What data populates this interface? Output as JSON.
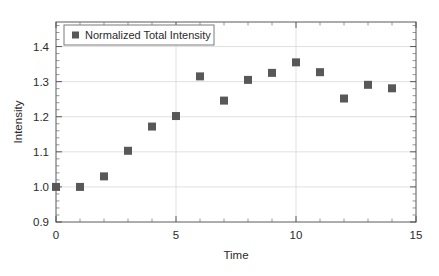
{
  "chart_data": {
    "type": "scatter",
    "title": "",
    "xlabel": "Time",
    "ylabel": "Intensity",
    "xlim": [
      0,
      15
    ],
    "ylim": [
      0.9,
      1.47
    ],
    "grid": true,
    "legend_position": "top-left",
    "marker": "filled-square",
    "marker_color": "#585858",
    "xticks": [
      0,
      5,
      10,
      15
    ],
    "xtick_labels": [
      "0",
      "5",
      "10",
      "15"
    ],
    "x_minor_tick_step": 1,
    "yticks": [
      0.9,
      1.0,
      1.1,
      1.2,
      1.3,
      1.4
    ],
    "ytick_labels": [
      "0.9",
      "1.0",
      "1.1",
      "1.2",
      "1.3",
      "1.4"
    ],
    "y_minor_tick_step": 0.02,
    "series": [
      {
        "name": "Normalized Total Intensity",
        "x": [
          0,
          1,
          2,
          3,
          4,
          5,
          6,
          7,
          8,
          9,
          10,
          11,
          12,
          13,
          14
        ],
        "values": [
          1.0,
          1.0,
          1.03,
          1.103,
          1.172,
          1.202,
          1.315,
          1.246,
          1.305,
          1.325,
          1.355,
          1.327,
          1.252,
          1.291,
          1.281
        ]
      }
    ]
  },
  "legend": {
    "entries": [
      {
        "label": "Normalized Total Intensity",
        "swatch": "legend-square-marker"
      }
    ]
  },
  "axes": {
    "x_title": "Time",
    "y_title": "Intensity"
  }
}
